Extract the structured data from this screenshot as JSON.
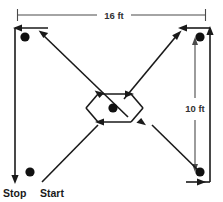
{
  "figure": {
    "dimensions": {
      "width_label": "16 ft",
      "height_label": "10 ft"
    },
    "labels": {
      "stop": "Stop",
      "start": "Start"
    },
    "colors": {
      "path_stroke": "#1a1a1a",
      "dimension_stroke": "#4a4a4a",
      "dot_fill": "#111111",
      "background": "#ffffff"
    },
    "markers": [
      {
        "name": "cone-top-left",
        "cx": 25,
        "cy": 37,
        "r": 4.6
      },
      {
        "name": "cone-top-right",
        "cx": 200,
        "cy": 37,
        "r": 4.6
      },
      {
        "name": "cone-center",
        "cx": 113,
        "cy": 108,
        "r": 4.6
      },
      {
        "name": "cone-bottom-left",
        "cx": 30,
        "cy": 172,
        "r": 4.6
      },
      {
        "name": "cone-bottom-right",
        "cx": 200,
        "cy": 172,
        "r": 4.6
      }
    ]
  }
}
